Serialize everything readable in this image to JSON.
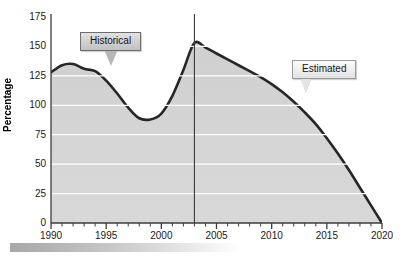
{
  "chart_data": {
    "type": "area",
    "title": "",
    "xlabel": "",
    "ylabel": "Percentage",
    "xlim": [
      1990,
      2020
    ],
    "ylim": [
      0,
      175
    ],
    "ytick_labels": [
      "0",
      "25",
      "50",
      "75",
      "100",
      "125",
      "150",
      "175"
    ],
    "ytick_values": [
      0,
      25,
      50,
      75,
      100,
      125,
      150,
      175
    ],
    "xtick_labels": [
      "1990",
      "1995",
      "2000",
      "2005",
      "2010",
      "2015",
      "2020"
    ],
    "xtick_values": [
      1990,
      1995,
      2000,
      2005,
      2010,
      2015,
      2020
    ],
    "minor_xticks_every": 1,
    "grid": "horizontal-only",
    "legend": "none",
    "x": [
      1990,
      1991,
      1992,
      1993,
      1994,
      1995,
      1996,
      1997,
      1998,
      1999,
      2000,
      2001,
      2002,
      2003,
      2004,
      2005,
      2006,
      2007,
      2008,
      2009,
      2010,
      2011,
      2012,
      2013,
      2014,
      2015,
      2016,
      2017,
      2018,
      2019,
      2020
    ],
    "values": [
      128,
      134,
      135,
      131,
      129,
      121,
      110,
      98,
      89,
      88,
      93,
      108,
      130,
      153,
      149,
      144,
      139,
      134,
      129,
      124,
      118,
      111,
      103,
      94,
      84,
      72,
      59,
      45,
      30,
      15,
      0
    ],
    "series": [
      {
        "name": "Percentage",
        "values": [
          128,
          134,
          135,
          131,
          129,
          121,
          110,
          98,
          89,
          88,
          93,
          108,
          130,
          153,
          149,
          144,
          139,
          134,
          129,
          124,
          118,
          111,
          103,
          94,
          84,
          72,
          59,
          45,
          30,
          15,
          0
        ]
      }
    ],
    "divider_line_x": 2003,
    "annotations": [
      {
        "label": "Historical",
        "points_to_x": 1998,
        "region": "1990-2003"
      },
      {
        "label": "Estimated",
        "points_to_x": 2012,
        "region": "2003-2020"
      }
    ],
    "colors": {
      "line": "#262626",
      "fill": "#d2d2d2",
      "gridline": "#ffffff",
      "axis": "#3c3c3c",
      "background": "#ffffff"
    }
  },
  "annotations": {
    "historical": {
      "label": "Historical"
    },
    "estimated": {
      "label": "Estimated"
    }
  },
  "axes": {
    "y_title": "Percentage",
    "y_ticks": [
      "175",
      "150",
      "125",
      "100",
      "75",
      "50",
      "25",
      "0"
    ],
    "x_ticks": [
      "1990",
      "1995",
      "2000",
      "2005",
      "2010",
      "2015",
      "2020"
    ]
  }
}
